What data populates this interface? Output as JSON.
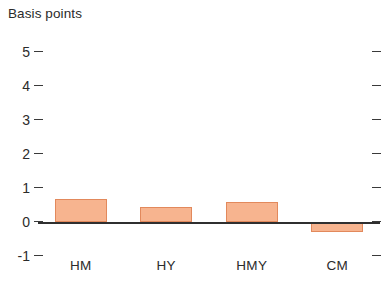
{
  "chart_data": {
    "type": "bar",
    "title": "",
    "ylabel": "Basis points",
    "xlabel": "",
    "categories": [
      "HM",
      "HY",
      "HMY",
      "CM"
    ],
    "values": [
      0.68,
      0.45,
      0.58,
      -0.28
    ],
    "ylim": [
      -1,
      5
    ],
    "yticks": [
      5,
      4,
      3,
      2,
      1,
      0,
      -1
    ],
    "ytick_labels": [
      "5",
      "4",
      "3",
      "2",
      "1",
      "0",
      "-1"
    ],
    "grid": false,
    "legend": null,
    "series": [
      {
        "name": "Basis points",
        "values": [
          0.68,
          0.45,
          0.58,
          -0.28
        ],
        "color": "#f7b48f",
        "border_color": "#e2895c"
      }
    ],
    "colors": {
      "bar_fill": "#f7b48f",
      "bar_border": "#e2895c",
      "axis": "#2f2f2f",
      "text": "#2b2b2b",
      "background": "#ffffff"
    },
    "axis_style": {
      "ticks_left": true,
      "ticks_right": true,
      "zero_line": true
    }
  }
}
